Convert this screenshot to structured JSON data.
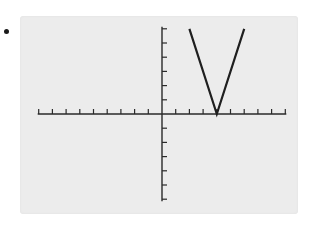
{
  "chart_data": {
    "type": "line",
    "title": "",
    "xlabel": "",
    "ylabel": "",
    "function": "y = 3|x - 4|",
    "xlim": [
      -9,
      9
    ],
    "ylim": [
      -6,
      6
    ],
    "x_tick_step": 1,
    "y_tick_step": 1,
    "grid": false,
    "legend": null,
    "series": [
      {
        "name": "V-shaped absolute value graph",
        "x": [
          2,
          4,
          6
        ],
        "y": [
          6,
          0,
          6
        ]
      }
    ],
    "vertex": [
      4,
      0
    ]
  },
  "colors": {
    "screen_background": "#ececec",
    "axis": "#2a2a2a",
    "curve": "#1f1f1f",
    "bullet": "#1a1a1a"
  }
}
